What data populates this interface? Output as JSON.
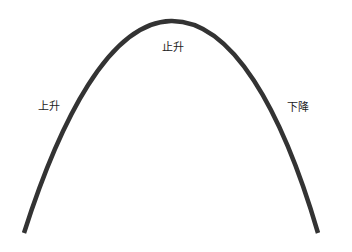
{
  "diagram": {
    "type": "parabolic-arc",
    "curve_color": "#333333",
    "labels": {
      "left": "上升",
      "top": "止升",
      "right": "下降"
    }
  }
}
